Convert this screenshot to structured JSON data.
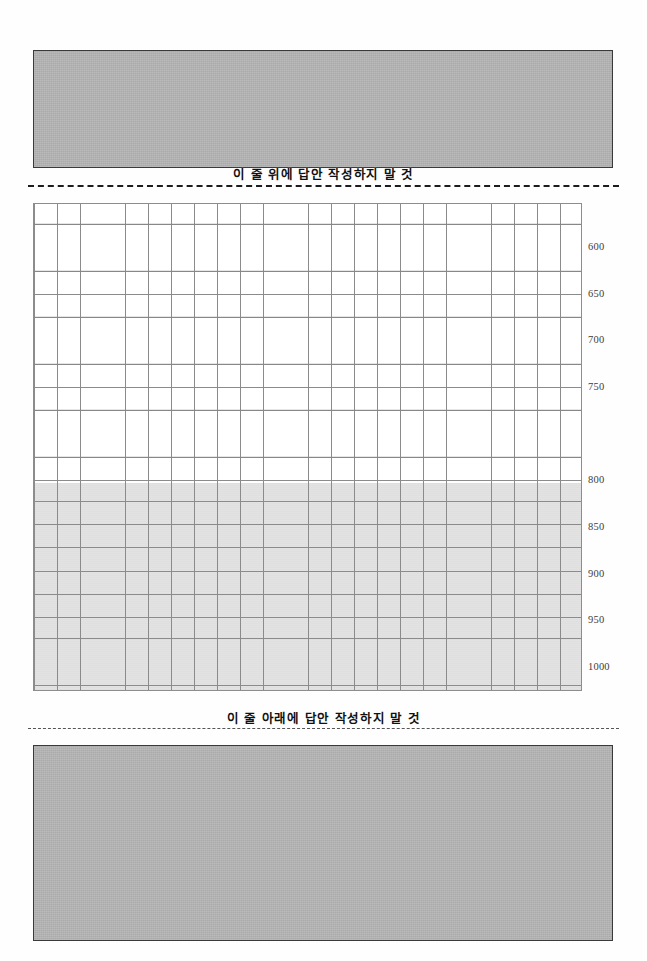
{
  "page": {
    "background_color": "#fefefe",
    "width": 647,
    "height": 961
  },
  "masked_regions": {
    "top": {
      "name": "top-redacted-block",
      "fill_color": "#b4b4b4",
      "border_color": "#3a3a3a"
    },
    "bottom": {
      "name": "bottom-redacted-block",
      "fill_color": "#b4b4b4",
      "border_color": "#3a3a3a"
    }
  },
  "rules": {
    "top": {
      "caption": "이 줄 위에 답안 작성하지 말 것",
      "style": "dashed",
      "color": "#1c1c1c"
    },
    "bottom": {
      "caption": "이 줄 아래에 답안 작성하지 말 것",
      "style": "dashed",
      "color": "#555555"
    }
  },
  "answer_grid": {
    "columns": 24,
    "rows": 21,
    "cell_width": 22.875,
    "cell_height": 23.24,
    "line_color": "#8b8b8b",
    "white_rows": 12,
    "shaded_rows": 9,
    "shade_color": "#e2e2e2"
  },
  "count_ruler": {
    "unit": "characters",
    "ticks": [
      {
        "label": "600",
        "y": 44
      },
      {
        "label": "650",
        "y": 91
      },
      {
        "label": "700",
        "y": 137
      },
      {
        "label": "750",
        "y": 184
      },
      {
        "label": "800",
        "y": 277
      },
      {
        "label": "850",
        "y": 324
      },
      {
        "label": "900",
        "y": 371
      },
      {
        "label": "950",
        "y": 417
      },
      {
        "label": "1000",
        "y": 464
      }
    ]
  }
}
